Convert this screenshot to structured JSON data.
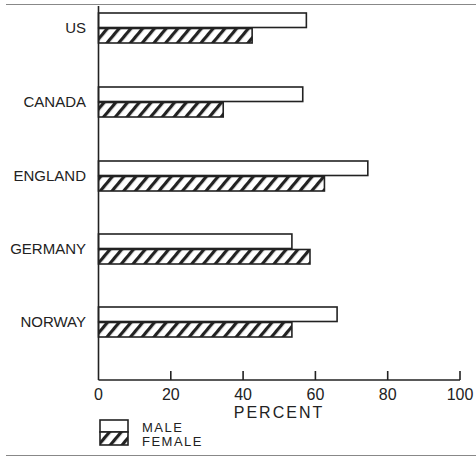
{
  "chart_data": {
    "type": "bar",
    "orientation": "horizontal",
    "title": "",
    "categories": [
      "US",
      "CANADA",
      "ENGLAND",
      "GERMANY",
      "NORWAY"
    ],
    "series": [
      {
        "name": "MALE",
        "pattern": "open",
        "values": [
          57.5,
          56.5,
          74.5,
          53.5,
          66
        ]
      },
      {
        "name": "FEMALE",
        "pattern": "hatched",
        "values": [
          42.5,
          34.5,
          62.5,
          58.5,
          53.5
        ]
      }
    ],
    "xlabel": "PERCENT",
    "ylabel": "",
    "xlim": [
      0,
      100
    ],
    "xticks": [
      "0",
      "20",
      "40",
      "60",
      "80",
      "100"
    ],
    "grid": false,
    "legend": {
      "position": "bottom-left",
      "entries": [
        "MALE",
        "FEMALE"
      ]
    }
  },
  "colors": {
    "ink": "#222222",
    "rule": "#888888",
    "background": "#ffffff"
  }
}
